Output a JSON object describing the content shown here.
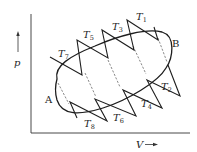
{
  "diagram": {
    "type": "thermodynamic p-V cycle diagram",
    "axes": {
      "y_label": "p",
      "x_label": "V"
    },
    "cycle": {
      "shape": "ellipse",
      "points": [
        {
          "id": "A",
          "label": "A"
        },
        {
          "id": "B",
          "label": "B"
        }
      ]
    },
    "isotherms": [
      {
        "symbol": "T",
        "sub": "1"
      },
      {
        "symbol": "T",
        "sub": "2"
      },
      {
        "symbol": "T",
        "sub": "3"
      },
      {
        "symbol": "T",
        "sub": "4"
      },
      {
        "symbol": "T",
        "sub": "5"
      },
      {
        "symbol": "T",
        "sub": "6"
      },
      {
        "symbol": "T",
        "sub": "7"
      },
      {
        "symbol": "T",
        "sub": "8"
      }
    ]
  }
}
